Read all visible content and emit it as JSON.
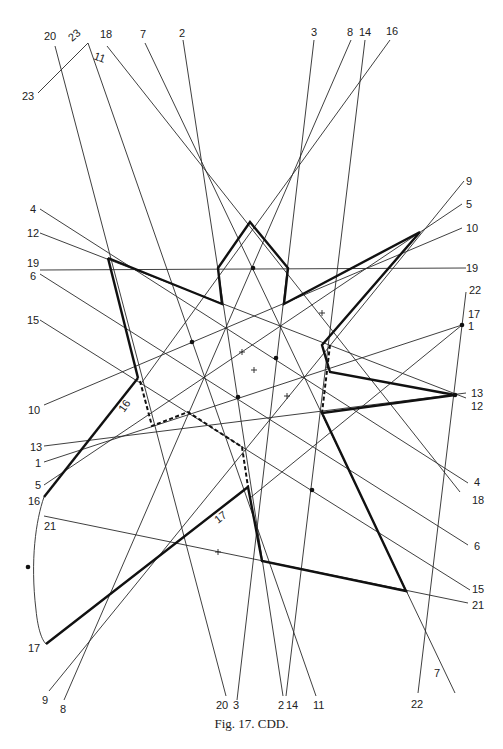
{
  "caption": "Fig. 17. CDD.",
  "thin_lines": [
    {
      "id": "2",
      "x1": 183,
      "y1": 40,
      "x2": 283,
      "y2": 696
    },
    {
      "id": "3",
      "x1": 314,
      "y1": 40,
      "x2": 237,
      "y2": 700
    },
    {
      "id": "7",
      "x1": 145,
      "y1": 43,
      "x2": 455,
      "y2": 693
    },
    {
      "id": "8",
      "x1": 351,
      "y1": 40,
      "x2": 64,
      "y2": 700
    },
    {
      "id": "9",
      "x1": 464,
      "y1": 181,
      "x2": 49,
      "y2": 691
    },
    {
      "id": "11",
      "x1": 88,
      "y1": 43,
      "x2": 316,
      "y2": 696
    },
    {
      "id": "14",
      "x1": 365,
      "y1": 40,
      "x2": 286,
      "y2": 696
    },
    {
      "id": "16",
      "x1": 390,
      "y1": 40,
      "x2": 140,
      "y2": 385
    },
    {
      "id": "18",
      "x1": 107,
      "y1": 46,
      "x2": 460,
      "y2": 492
    },
    {
      "id": "20",
      "x1": 55,
      "y1": 46,
      "x2": 226,
      "y2": 696
    },
    {
      "id": "22",
      "x1": 466,
      "y1": 292,
      "x2": 418,
      "y2": 693
    },
    {
      "id": "23",
      "x1": 38,
      "y1": 93,
      "x2": 88,
      "y2": 43
    },
    {
      "id": "4",
      "x1": 40,
      "y1": 209,
      "x2": 468,
      "y2": 483
    },
    {
      "id": "12",
      "x1": 40,
      "y1": 233,
      "x2": 466,
      "y2": 398
    },
    {
      "id": "19",
      "x1": 40,
      "y1": 270,
      "x2": 466,
      "y2": 268
    },
    {
      "id": "6",
      "x1": 40,
      "y1": 274,
      "x2": 468,
      "y2": 545
    },
    {
      "id": "15",
      "x1": 40,
      "y1": 320,
      "x2": 470,
      "y2": 590
    },
    {
      "id": "10",
      "x1": 44,
      "y1": 405,
      "x2": 462,
      "y2": 228
    },
    {
      "id": "5",
      "x1": 44,
      "y1": 485,
      "x2": 462,
      "y2": 204
    },
    {
      "id": "1",
      "x1": 44,
      "y1": 462,
      "x2": 462,
      "y2": 325
    },
    {
      "id": "13",
      "x1": 44,
      "y1": 446,
      "x2": 466,
      "y2": 393
    },
    {
      "id": "17b",
      "x1": 250,
      "y1": 498,
      "x2": 462,
      "y2": 325
    },
    {
      "id": "21",
      "x1": 44,
      "y1": 516,
      "x2": 468,
      "y2": 603
    }
  ],
  "thick_paths": [
    {
      "id": "star",
      "points": "108,258 222,304 218,268 250,222 288,268 284,304 420,232 322,345 330,372 455,395 322,413 406,591 262,561 248,487 46,644"
    },
    {
      "id": "edge-16",
      "points": "138,378 44,497"
    },
    {
      "id": "star-left",
      "points": "108,258 138,378"
    }
  ],
  "dashed_paths": [
    {
      "id": "dash-left",
      "points": "140,381 152,426 188,412 242,447 248,487"
    },
    {
      "id": "dash-right",
      "points": "330,345 322,413"
    }
  ],
  "curves": [
    {
      "id": "arc-16-17",
      "d": "M44,497 C36,520 30,560 36,610 C38,630 42,640 46,644"
    }
  ],
  "dots": [
    {
      "x": 253,
      "y": 268
    },
    {
      "x": 192,
      "y": 342
    },
    {
      "x": 276,
      "y": 358
    },
    {
      "x": 238,
      "y": 397
    },
    {
      "x": 312,
      "y": 490
    },
    {
      "x": 28,
      "y": 567
    },
    {
      "x": 455,
      "y": 395
    },
    {
      "x": 462,
      "y": 325
    }
  ],
  "ticks": [
    {
      "x": 322,
      "y": 313
    },
    {
      "x": 242,
      "y": 352
    },
    {
      "x": 287,
      "y": 396
    },
    {
      "x": 218,
      "y": 552
    },
    {
      "x": 254,
      "y": 370
    }
  ],
  "labels": [
    {
      "text": "20",
      "x": 44,
      "y": 40
    },
    {
      "text": "23",
      "x": 72,
      "y": 42,
      "rotate": -40
    },
    {
      "text": "11",
      "x": 93,
      "y": 59,
      "rotate": 20
    },
    {
      "text": "23",
      "x": 22,
      "y": 100
    },
    {
      "text": "18",
      "x": 100,
      "y": 38
    },
    {
      "text": "7",
      "x": 140,
      "y": 38
    },
    {
      "text": "2",
      "x": 179,
      "y": 37
    },
    {
      "text": "3",
      "x": 311,
      "y": 36
    },
    {
      "text": "8",
      "x": 347,
      "y": 36
    },
    {
      "text": "14",
      "x": 359,
      "y": 36
    },
    {
      "text": "16",
      "x": 386,
      "y": 35
    },
    {
      "text": "9",
      "x": 466,
      "y": 185
    },
    {
      "text": "4",
      "x": 30,
      "y": 213
    },
    {
      "text": "5",
      "x": 466,
      "y": 208
    },
    {
      "text": "12",
      "x": 27,
      "y": 237
    },
    {
      "text": "10",
      "x": 466,
      "y": 232
    },
    {
      "text": "19",
      "x": 27,
      "y": 267
    },
    {
      "text": "19",
      "x": 466,
      "y": 272
    },
    {
      "text": "6",
      "x": 30,
      "y": 280
    },
    {
      "text": "22",
      "x": 469,
      "y": 294
    },
    {
      "text": "17",
      "x": 468,
      "y": 318
    },
    {
      "text": "1",
      "x": 468,
      "y": 330
    },
    {
      "text": "15",
      "x": 27,
      "y": 324
    },
    {
      "text": "10",
      "x": 28,
      "y": 414
    },
    {
      "text": "13",
      "x": 471,
      "y": 397
    },
    {
      "text": "12",
      "x": 471,
      "y": 410
    },
    {
      "text": "13",
      "x": 30,
      "y": 451
    },
    {
      "text": "1",
      "x": 35,
      "y": 467
    },
    {
      "text": "5",
      "x": 35,
      "y": 489
    },
    {
      "text": "16",
      "x": 28,
      "y": 505
    },
    {
      "text": "4",
      "x": 474,
      "y": 486
    },
    {
      "text": "18",
      "x": 472,
      "y": 504
    },
    {
      "text": "21",
      "x": 44,
      "y": 530
    },
    {
      "text": "6",
      "x": 474,
      "y": 550
    },
    {
      "text": "15",
      "x": 472,
      "y": 593
    },
    {
      "text": "21",
      "x": 472,
      "y": 609
    },
    {
      "text": "17",
      "x": 28,
      "y": 652
    },
    {
      "text": "7",
      "x": 434,
      "y": 677
    },
    {
      "text": "9",
      "x": 42,
      "y": 704
    },
    {
      "text": "8",
      "x": 60,
      "y": 713
    },
    {
      "text": "20",
      "x": 216,
      "y": 709
    },
    {
      "text": "3",
      "x": 233,
      "y": 709
    },
    {
      "text": "2",
      "x": 278,
      "y": 709
    },
    {
      "text": "14",
      "x": 286,
      "y": 709
    },
    {
      "text": "11",
      "x": 313,
      "y": 709
    },
    {
      "text": "22",
      "x": 411,
      "y": 708
    }
  ],
  "segment_labels": [
    {
      "text": "16",
      "x": 124,
      "y": 413,
      "rotate": -55,
      "size": 13
    },
    {
      "text": "17",
      "x": 218,
      "y": 524,
      "rotate": -38,
      "size": 13
    }
  ]
}
